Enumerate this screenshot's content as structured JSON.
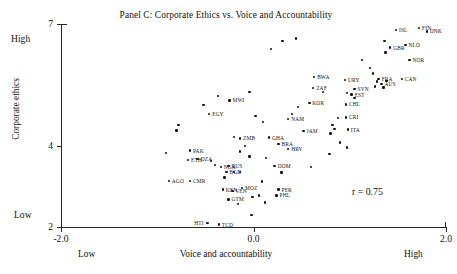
{
  "chart_data": {
    "type": "scatter",
    "title": "Panel C: Corporate Ethics vs. Voice and Accountability",
    "xlabel": "Voice and accountability",
    "ylabel": "Corporate ethics",
    "xlim": [
      -2.0,
      2.0
    ],
    "ylim": [
      2,
      7
    ],
    "xticks": [
      "-2.0",
      "0.0",
      "2.0"
    ],
    "xtick_values": [
      -2.0,
      0.0,
      2.0
    ],
    "yticks": [
      "7",
      "4",
      "2"
    ],
    "ytick_values": [
      7,
      4,
      2
    ],
    "x_axis_low_label": "Low",
    "x_axis_high_label": "High",
    "y_axis_low_label": "Low",
    "y_axis_high_label": "High",
    "grid": false,
    "legend": false,
    "annotation": "r = 0.75",
    "correlation": 0.75,
    "marker_color": "#111111",
    "axis_color": "#2a2623",
    "background_color": "#ffffff",
    "points": [
      {
        "label": "ISL",
        "x": 1.48,
        "y": 6.85,
        "lp": "right"
      },
      {
        "label": "FIN",
        "x": 1.72,
        "y": 6.9,
        "lp": "right"
      },
      {
        "label": "DNK",
        "x": 1.8,
        "y": 6.82,
        "lp": "right"
      },
      {
        "label": "GBR",
        "x": 1.42,
        "y": 6.42,
        "lp": "right"
      },
      {
        "label": "NLD",
        "x": 1.58,
        "y": 6.48,
        "lp": "right"
      },
      {
        "label": "NOR",
        "x": 1.62,
        "y": 6.12,
        "lp": "right"
      },
      {
        "label": "CAN",
        "x": 1.54,
        "y": 5.65,
        "lp": "right"
      },
      {
        "label": "BWA",
        "x": 0.63,
        "y": 5.7,
        "lp": "right"
      },
      {
        "label": "URY",
        "x": 0.95,
        "y": 5.62,
        "lp": "right"
      },
      {
        "label": "FRA",
        "x": 1.3,
        "y": 5.65,
        "lp": "right"
      },
      {
        "label": "AUS",
        "x": 1.33,
        "y": 5.52,
        "lp": "right"
      },
      {
        "label": "ZAF",
        "x": 0.62,
        "y": 5.42,
        "lp": "right"
      },
      {
        "label": "SVN",
        "x": 1.05,
        "y": 5.4,
        "lp": "right"
      },
      {
        "label": "EST",
        "x": 1.02,
        "y": 5.26,
        "lp": "right"
      },
      {
        "label": "KOR",
        "x": 0.58,
        "y": 5.06,
        "lp": "right"
      },
      {
        "label": "CHL",
        "x": 0.96,
        "y": 5.02,
        "lp": "right"
      },
      {
        "label": "CRI",
        "x": 0.96,
        "y": 4.7,
        "lp": "right"
      },
      {
        "label": "NAM",
        "x": 0.36,
        "y": 4.66,
        "lp": "right"
      },
      {
        "label": "ITA",
        "x": 0.98,
        "y": 4.4,
        "lp": "right"
      },
      {
        "label": "JAM",
        "x": 0.52,
        "y": 4.37,
        "lp": "right"
      },
      {
        "label": "MWI",
        "x": -0.25,
        "y": 5.12,
        "lp": "right"
      },
      {
        "label": "EGY",
        "x": -0.46,
        "y": 4.78,
        "lp": "right"
      },
      {
        "label": "ZMB",
        "x": -0.14,
        "y": 4.18,
        "lp": "right"
      },
      {
        "label": "GHA",
        "x": 0.16,
        "y": 4.2,
        "lp": "right"
      },
      {
        "label": "BRA",
        "x": 0.26,
        "y": 4.05,
        "lp": "right"
      },
      {
        "label": "HRV",
        "x": 0.36,
        "y": 3.92,
        "lp": "right"
      },
      {
        "label": "PAK",
        "x": -0.66,
        "y": 3.88,
        "lp": "right"
      },
      {
        "label": "ETH",
        "x": -0.68,
        "y": 3.65,
        "lp": "right"
      },
      {
        "label": "DZA",
        "x": -0.58,
        "y": 3.67,
        "lp": "right"
      },
      {
        "label": "NGA",
        "x": -0.34,
        "y": 3.48,
        "lp": "right"
      },
      {
        "label": "RUS",
        "x": -0.26,
        "y": 3.5,
        "lp": "right"
      },
      {
        "label": "BGD",
        "x": -0.28,
        "y": 3.36,
        "lp": "right"
      },
      {
        "label": "DOM",
        "x": 0.22,
        "y": 3.5,
        "lp": "right"
      },
      {
        "label": "AGO",
        "x": -0.88,
        "y": 3.14,
        "lp": "right"
      },
      {
        "label": "CMR",
        "x": -0.66,
        "y": 3.14,
        "lp": "right"
      },
      {
        "label": "KEN",
        "x": -0.32,
        "y": 2.92,
        "lp": "right"
      },
      {
        "label": "VEN",
        "x": -0.22,
        "y": 2.88,
        "lp": "right"
      },
      {
        "label": "MOZ",
        "x": -0.12,
        "y": 2.96,
        "lp": "right"
      },
      {
        "label": "PER",
        "x": 0.26,
        "y": 2.92,
        "lp": "right"
      },
      {
        "label": "PHL",
        "x": 0.24,
        "y": 2.78,
        "lp": "right"
      },
      {
        "label": "GTM",
        "x": -0.26,
        "y": 2.68,
        "lp": "right"
      },
      {
        "label": "HTI",
        "x": -0.48,
        "y": 2.1,
        "lp": "left"
      },
      {
        "label": "TCD",
        "x": -0.36,
        "y": 2.06,
        "lp": "right"
      }
    ],
    "unlabeled_points": [
      {
        "x": 0.3,
        "y": 6.58
      },
      {
        "x": 0.44,
        "y": 6.64
      },
      {
        "x": 0.18,
        "y": 6.38
      },
      {
        "x": 1.36,
        "y": 6.58
      },
      {
        "x": 1.37,
        "y": 6.3
      },
      {
        "x": 1.13,
        "y": 6.12
      },
      {
        "x": 1.21,
        "y": 5.92
      },
      {
        "x": 1.24,
        "y": 5.78
      },
      {
        "x": 1.28,
        "y": 5.58
      },
      {
        "x": 1.35,
        "y": 5.44
      },
      {
        "x": 1.38,
        "y": 5.6
      },
      {
        "x": 1.26,
        "y": 5.46
      },
      {
        "x": 1.05,
        "y": 5.18
      },
      {
        "x": 0.97,
        "y": 5.3
      },
      {
        "x": 0.72,
        "y": 5.32
      },
      {
        "x": 0.88,
        "y": 4.68
      },
      {
        "x": 0.84,
        "y": 4.42
      },
      {
        "x": 0.8,
        "y": 4.3
      },
      {
        "x": 0.82,
        "y": 4.52
      },
      {
        "x": 0.79,
        "y": 3.8
      },
      {
        "x": 0.9,
        "y": 4.08
      },
      {
        "x": -0.04,
        "y": 5.32
      },
      {
        "x": -0.37,
        "y": 5.22
      },
      {
        "x": -0.52,
        "y": 5.0
      },
      {
        "x": -0.78,
        "y": 4.52
      },
      {
        "x": -0.8,
        "y": 4.38
      },
      {
        "x": 0.02,
        "y": 4.74
      },
      {
        "x": 0.1,
        "y": 4.58
      },
      {
        "x": -0.2,
        "y": 4.22
      },
      {
        "x": -0.09,
        "y": 4.0
      },
      {
        "x": -0.14,
        "y": 3.86
      },
      {
        "x": -0.04,
        "y": 3.74
      },
      {
        "x": -0.91,
        "y": 3.82
      },
      {
        "x": -0.4,
        "y": 3.52
      },
      {
        "x": -0.2,
        "y": 3.36
      },
      {
        "x": -0.14,
        "y": 3.36
      },
      {
        "x": 0.13,
        "y": 3.7
      },
      {
        "x": 0.29,
        "y": 3.34
      },
      {
        "x": 0.6,
        "y": 3.48
      },
      {
        "x": 0.09,
        "y": 3.12
      },
      {
        "x": -0.01,
        "y": 2.74
      },
      {
        "x": 0.06,
        "y": 2.78
      },
      {
        "x": 0.12,
        "y": 2.6
      },
      {
        "x": -0.16,
        "y": 2.56
      },
      {
        "x": -0.02,
        "y": 2.3
      },
      {
        "x": 0.4,
        "y": 4.78
      },
      {
        "x": 0.46,
        "y": 4.96
      },
      {
        "x": -0.44,
        "y": 3.62
      },
      {
        "x": -0.3,
        "y": 3.22
      },
      {
        "x": 0.97,
        "y": 3.96
      }
    ]
  }
}
